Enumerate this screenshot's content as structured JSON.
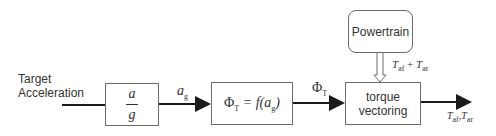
{
  "diagram": {
    "input_label": "Target Acceleration",
    "blocks": {
      "normalize": {
        "numerator": "a",
        "denominator": "g"
      },
      "phi_function": {
        "lhs": "Φ",
        "lhs_sub": "T",
        "eq": "= f(a",
        "arg_sub": "g",
        "close": ")"
      },
      "torque_vectoring": {
        "line1": "torque",
        "line2": "vectoring"
      },
      "powertrain": {
        "label": "Powertrain"
      }
    },
    "signals": {
      "ag": {
        "base": "a",
        "sub": "g"
      },
      "phi_t": {
        "base": "Φ",
        "sub": "T"
      },
      "powertrain_out": {
        "t1": "T",
        "t1_sub": "af",
        "op": "+",
        "t2": "T",
        "t2_sub": "ar"
      },
      "output": {
        "t1": "T",
        "t1_sub": "af",
        "sep": ",",
        "t2": "T",
        "t2_sub": "ar"
      }
    },
    "colors": {
      "line": "#1a1a1a",
      "box_border": "#6d6d6d",
      "text": "#333333"
    }
  }
}
